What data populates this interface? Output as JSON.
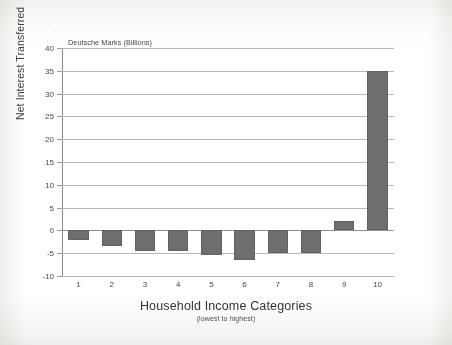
{
  "chart_data": {
    "type": "bar",
    "title": "",
    "unit_note": "Deutsche Marks (Billions)",
    "xlabel": "Household Income Categories",
    "xlabel_sub": "(lowest to highest)",
    "ylabel": "Net Interest Transferred",
    "categories": [
      "1",
      "2",
      "3",
      "4",
      "5",
      "6",
      "7",
      "8",
      "9",
      "10"
    ],
    "values": [
      -2,
      -3.5,
      -4.5,
      -4.5,
      -5.5,
      -6.5,
      -5,
      -5,
      2,
      35
    ],
    "ylim": [
      -10,
      40
    ],
    "ytick_labels": [
      "40",
      "35",
      "30",
      "25",
      "20",
      "15",
      "10",
      "5",
      "0",
      "-5",
      "-10"
    ],
    "ytick_values": [
      40,
      35,
      30,
      25,
      20,
      15,
      10,
      5,
      0,
      -5,
      -10
    ],
    "grid": true,
    "legend": "none",
    "bar_color": "#6e6e70",
    "gridline_color": "#b7b7b5",
    "axis_color": "#8a8a88"
  }
}
